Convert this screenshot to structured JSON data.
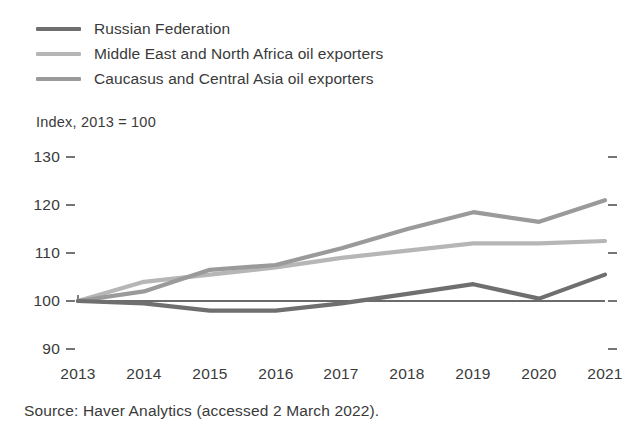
{
  "chart_data": {
    "type": "line",
    "title": "",
    "subtitle": "",
    "ylabel": "Index,  2013 = 100",
    "xlabel": "",
    "x": [
      2013,
      2014,
      2015,
      2016,
      2017,
      2018,
      2019,
      2020,
      2021
    ],
    "categories": [
      "2013",
      "2014",
      "2015",
      "2016",
      "2017",
      "2018",
      "2019",
      "2020",
      "2021"
    ],
    "ylim": [
      90,
      130
    ],
    "yticks": [
      90,
      100,
      110,
      120,
      130
    ],
    "ytick_labels": [
      "90",
      "100",
      "110",
      "120",
      "130"
    ],
    "grid": false,
    "legend_position": "top-left",
    "series": [
      {
        "name": "Russian Federation",
        "color": "#6f6f6f",
        "values": [
          100,
          99.5,
          98,
          98,
          99.5,
          101.5,
          103.5,
          100.5,
          105.5
        ]
      },
      {
        "name": "Middle East and North Africa oil exporters",
        "color": "#b6b6b6",
        "values": [
          100,
          104,
          105.5,
          107,
          109,
          110.5,
          112,
          112,
          112.5
        ]
      },
      {
        "name": "Caucasus and Central Asia oil exporters",
        "color": "#9a9a9a",
        "values": [
          100,
          102,
          106.5,
          107.5,
          111,
          115,
          118.5,
          116.5,
          121
        ]
      }
    ],
    "source": "Source: Haver Analytics (accessed 2 March 2022)."
  },
  "legend": {
    "items": [
      {
        "label": "Russian Federation",
        "color": "#6f6f6f"
      },
      {
        "label": "Middle East and North Africa oil exporters",
        "color": "#b6b6b6"
      },
      {
        "label": "Caucasus and Central Asia oil exporters",
        "color": "#9a9a9a"
      }
    ]
  },
  "axes": {
    "y_title": "Index,  2013 = 100",
    "y_ticks": [
      "130",
      "120",
      "110",
      "100",
      "90"
    ],
    "x_ticks": [
      "2013",
      "2014",
      "2015",
      "2016",
      "2017",
      "2018",
      "2019",
      "2020",
      "2021"
    ]
  },
  "footer": {
    "source": "Source: Haver Analytics (accessed 2 March 2022)."
  },
  "colors": {
    "axis": "#3a3a3a",
    "text": "#3a3a3a",
    "background": "#ffffff"
  }
}
